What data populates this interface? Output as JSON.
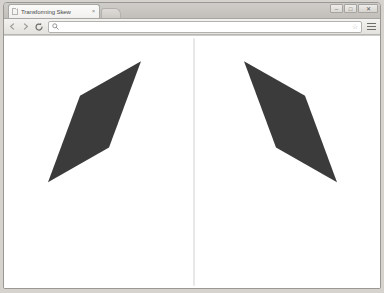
{
  "window": {
    "controls": [
      {
        "name": "minimize",
        "glyph": "–"
      },
      {
        "name": "maximize",
        "glyph": "□"
      },
      {
        "name": "close",
        "glyph": "✕"
      }
    ]
  },
  "tabstrip": {
    "tabs": [
      {
        "title": "Transforming Skew",
        "favicon": "page-icon",
        "close_glyph": "×",
        "active": true
      }
    ],
    "new_tab_label": ""
  },
  "toolbar": {
    "back_label": "←",
    "forward_label": "→",
    "reload_label": "⟳",
    "omnibox": {
      "value": "",
      "placeholder": "",
      "search_icon": "search-icon",
      "star_icon": "☆"
    },
    "menu_label": "≡"
  },
  "page": {
    "background": "#ffffff",
    "divider": {
      "color": "#d8d8d8",
      "x": 190,
      "y1": 2,
      "y2": 217,
      "width": 1
    },
    "shapes": [
      {
        "name": "skewed-parallelogram-left",
        "fill": "#3b3b3b",
        "points": "44,127 76,52 137,22 105,97"
      },
      {
        "name": "skewed-parallelogram-right",
        "fill": "#3b3b3b",
        "points": "333,127 301,52 240,22 272,97"
      }
    ]
  }
}
